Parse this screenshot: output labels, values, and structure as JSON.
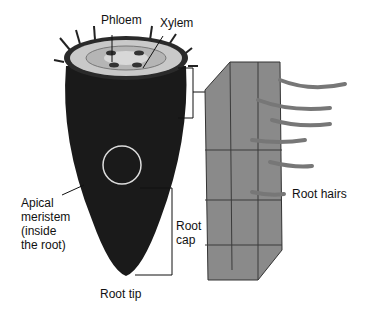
{
  "diagram": {
    "labels": {
      "phloem": "Phloem",
      "xylem": "Xylem",
      "apical_meristem": [
        "Apical",
        "meristem",
        "(inside",
        "the root)"
      ],
      "root_cap": [
        "Root",
        "cap"
      ],
      "root_tip": "Root tip",
      "root_hairs": "Root hairs"
    }
  }
}
